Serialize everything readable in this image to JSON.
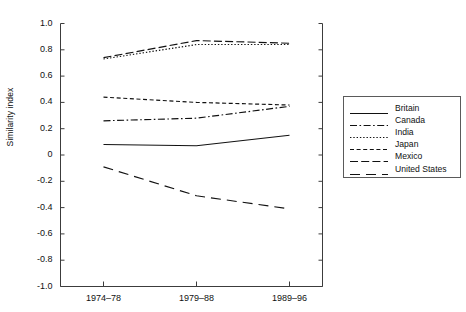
{
  "chart_data": {
    "type": "line",
    "title": "",
    "xlabel": "",
    "ylabel": "Similarity index",
    "categories": [
      "1974–78",
      "1979–88",
      "1989–96"
    ],
    "ylim": [
      -1.0,
      1.0
    ],
    "ytick_labels": [
      "1.0",
      "0.8",
      "0.6",
      "0.4",
      "0.2",
      "0",
      "-0.2",
      "-0.4",
      "-0.6",
      "-0.8",
      "-1.0"
    ],
    "ytick_values": [
      1.0,
      0.8,
      0.6,
      0.4,
      0.2,
      0,
      -0.2,
      -0.4,
      -0.6,
      -0.8,
      -1.0
    ],
    "grid": false,
    "legend_position": "right",
    "series": [
      {
        "name": "Britain",
        "values": [
          0.08,
          0.07,
          0.15
        ],
        "style": "solid"
      },
      {
        "name": "Canada",
        "values": [
          0.26,
          0.28,
          0.37
        ],
        "style": "dashdot"
      },
      {
        "name": "India",
        "values": [
          0.73,
          0.84,
          0.84
        ],
        "style": "dotted"
      },
      {
        "name": "Japan",
        "values": [
          0.44,
          0.4,
          0.38
        ],
        "style": "smalldash"
      },
      {
        "name": "Mexico",
        "values": [
          0.74,
          0.87,
          0.85
        ],
        "style": "dashed"
      },
      {
        "name": "United States",
        "values": [
          -0.09,
          -0.31,
          -0.41
        ],
        "style": "longdash"
      }
    ]
  },
  "legend": {
    "items": [
      {
        "label": "Britain"
      },
      {
        "label": "Canada"
      },
      {
        "label": "India"
      },
      {
        "label": "Japan"
      },
      {
        "label": "Mexico"
      },
      {
        "label": "United States"
      }
    ]
  },
  "colors": {
    "line": "#111111",
    "axis": "#3c3c3c",
    "background": "#ffffff"
  }
}
